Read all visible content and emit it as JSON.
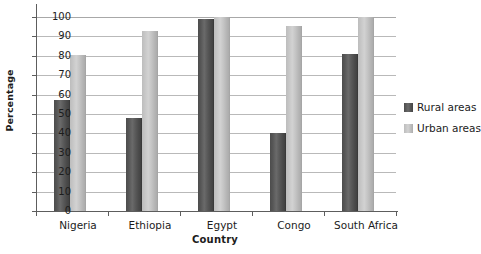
{
  "chart_data": {
    "type": "bar",
    "title": "",
    "xlabel": "Country",
    "ylabel": "Percentage",
    "categories": [
      "Nigeria",
      "Ethiopia",
      "Egypt",
      "Congo",
      "South Africa"
    ],
    "series": [
      {
        "name": "Rural areas",
        "color": "#555555",
        "values": [
          57,
          48,
          99,
          40,
          81
        ]
      },
      {
        "name": "Urban areas",
        "color": "#c8c8c8",
        "values": [
          80.5,
          93,
          100,
          95.5,
          100
        ]
      }
    ],
    "ylim": [
      0,
      100
    ],
    "yticks": [
      0,
      10,
      20,
      30,
      40,
      50,
      60,
      70,
      80,
      90,
      100
    ],
    "ytick_labels": [
      "0",
      "10",
      "20",
      "30",
      "40",
      "50",
      "60",
      "70",
      "80",
      "90",
      "100"
    ],
    "grid": "horizontal",
    "legend_position": "right"
  }
}
